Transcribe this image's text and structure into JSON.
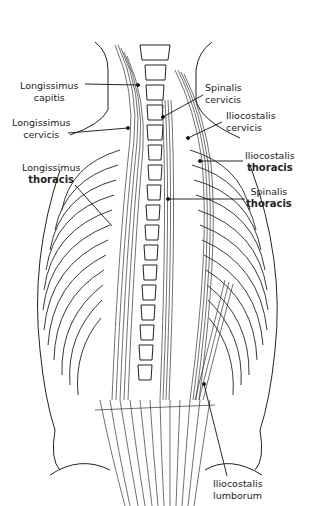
{
  "figure": {
    "labels": [
      {
        "id": "longissimus-capitis",
        "line1": "Longissimus",
        "line2": "capitis",
        "x": 20,
        "y": 80
      },
      {
        "id": "longissimus-cervicis",
        "line1": "Longissimus",
        "line2": "cervicis",
        "x": 12,
        "y": 117
      },
      {
        "id": "longissimus-thoracis",
        "line1": "Longissimus",
        "line2": "thoracis",
        "x": 22,
        "y": 162
      },
      {
        "id": "spinalis-cervicis",
        "line1": "Spinalis",
        "line2": "cervicis",
        "x": 205,
        "y": 82
      },
      {
        "id": "iliocostalis-cervicis",
        "line1": "Iliocostalis",
        "line2": "cervicis",
        "x": 226,
        "y": 110
      },
      {
        "id": "iliocostalis-thoracis",
        "line1": "Iliocostalis",
        "line2": "thoracis",
        "x": 245,
        "y": 150
      },
      {
        "id": "spinalis-thoracis",
        "line1": "Spinalis",
        "line2": "thoracis",
        "x": 246,
        "y": 186
      },
      {
        "id": "iliocostalis-lumborum",
        "line1": "Iliocostalis",
        "line2": "lumborum",
        "x": 213,
        "y": 478
      }
    ]
  }
}
